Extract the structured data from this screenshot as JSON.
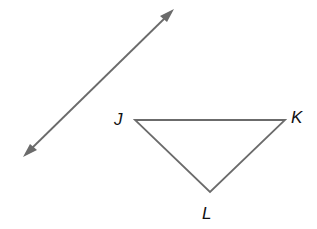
{
  "diagram": {
    "line": {
      "start": [
        23,
        157
      ],
      "end": [
        174,
        9
      ],
      "arrows": "both",
      "color": "#6b6b6b"
    },
    "triangle": {
      "color": "#6b6b6b",
      "vertices": [
        {
          "name": "J",
          "x": 135,
          "y": 120
        },
        {
          "name": "K",
          "x": 285,
          "y": 120
        },
        {
          "name": "L",
          "x": 210,
          "y": 192
        }
      ]
    },
    "labels": {
      "j": "J",
      "k": "K",
      "l": "L"
    }
  }
}
